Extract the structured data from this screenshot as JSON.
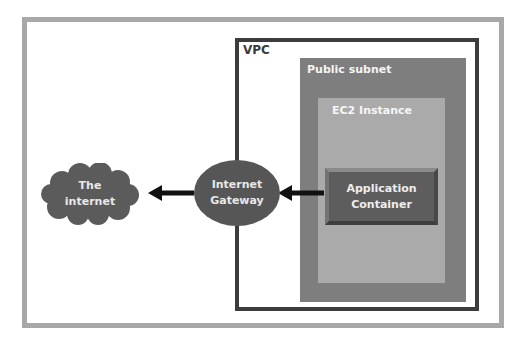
{
  "diagram": {
    "type": "network-architecture",
    "nodes": {
      "vpc": {
        "label": "VPC"
      },
      "public_subnet": {
        "label": "Public subnet"
      },
      "ec2_instance": {
        "label": "EC2 Instance"
      },
      "application_container": {
        "label": "Application\nContainer"
      },
      "internet_gateway": {
        "label": "Internet\nGateway"
      },
      "the_internet": {
        "label": "The\ninternet"
      }
    },
    "edges": [
      {
        "from": "application_container",
        "to": "internet_gateway",
        "style": "arrow"
      },
      {
        "from": "internet_gateway",
        "to": "the_internet",
        "style": "arrow"
      }
    ],
    "colors": {
      "outer_frame": "#a8a8a8",
      "vpc_border": "#3c3c3c",
      "public_subnet": "#7e7e7e",
      "ec2_instance": "#aaaaaa",
      "application_container": "#5d5d5d",
      "internet_gateway": "#565656",
      "the_internet": "#5b5b5b",
      "arrow": "#111111"
    }
  }
}
